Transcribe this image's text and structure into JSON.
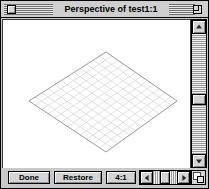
{
  "window": {
    "title": "Perspective of test1:1",
    "close_box_name": "close-box",
    "zoom_box_name": "zoom-box"
  },
  "toolbar": {
    "done_label": "Done",
    "restore_label": "Restore",
    "scale_value": "4:1"
  },
  "scrollbars": {
    "vertical": {
      "up_arrow": "▲",
      "down_arrow": "▼"
    },
    "horizontal": {
      "left_arrow": "◀",
      "right_arrow": "▶"
    }
  },
  "canvas": {
    "description": "Isometric perspective grid plane",
    "grid": {
      "divisions_u": 12,
      "divisions_v": 12,
      "line_color": "#d2d2d2",
      "edge_color": "#8f8f8f",
      "background": "#ffffff",
      "vertex_top": {
        "x": 103,
        "y": 32
      },
      "vertex_right": {
        "x": 174,
        "y": 81
      },
      "vertex_bottom": {
        "x": 103,
        "y": 132
      },
      "vertex_left": {
        "x": 26,
        "y": 81
      }
    }
  },
  "colors": {
    "window_chrome": "#c9c9c9",
    "titlebar": "#cfcfcf",
    "button_face": "#d4d4d4",
    "content_background": "#ffffff",
    "border": "#000000"
  }
}
